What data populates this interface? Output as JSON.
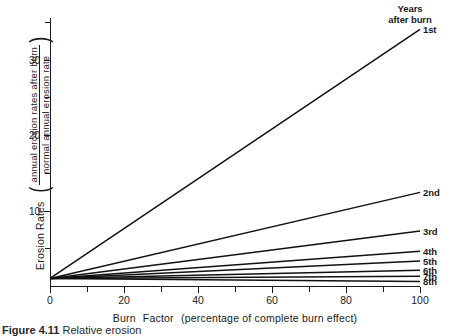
{
  "chart": {
    "ylabel_main": "Erosion Rates",
    "ylabel_numerator": "annual erosion rates after burn",
    "ylabel_denominator": "normal annual erosion rate",
    "xlabel_part1": "Burn",
    "xlabel_part2": "Factor",
    "xlabel_part3": "(percentage of complete burn effect)",
    "legend_title_line1": "Years",
    "legend_title_line2": "after burn",
    "caption_label": "Figure 4.11",
    "caption_text": "Relative erosion"
  },
  "chart_data": {
    "type": "line",
    "title": "",
    "xlabel": "Burn Factor (percentage of complete burn effect)",
    "ylabel": "Erosion Rates (annual erosion rates after burn / normal annual erosion rate)",
    "xlim": [
      0,
      100
    ],
    "ylim": [
      0,
      35.5
    ],
    "grid": false,
    "legend_position": "right-of-line-ends",
    "legend_title": "Years after burn",
    "x_ticks_major": [
      0,
      20,
      40,
      60,
      80,
      100
    ],
    "x_ticks_minor": [
      10,
      30,
      50,
      70,
      90
    ],
    "x_tick_labels": [
      "0",
      "20",
      "40",
      "60",
      "80",
      "100"
    ],
    "y_ticks_major": [
      10,
      20,
      30
    ],
    "y_ticks_minor": [
      5,
      15,
      25,
      35
    ],
    "y_tick_labels": [
      "10",
      "20",
      "30"
    ],
    "x": [
      0,
      100
    ],
    "series": [
      {
        "name": "1st",
        "values": [
          1.0,
          34.0
        ]
      },
      {
        "name": "2nd",
        "values": [
          1.0,
          12.4
        ]
      },
      {
        "name": "3rd",
        "values": [
          1.0,
          7.3
        ]
      },
      {
        "name": "4th",
        "values": [
          1.0,
          4.6
        ]
      },
      {
        "name": "5th",
        "values": [
          1.0,
          3.3
        ]
      },
      {
        "name": "6th",
        "values": [
          1.0,
          2.1
        ]
      },
      {
        "name": "7th",
        "values": [
          1.0,
          1.3
        ]
      },
      {
        "name": "8th",
        "values": [
          1.0,
          0.6
        ]
      }
    ]
  }
}
